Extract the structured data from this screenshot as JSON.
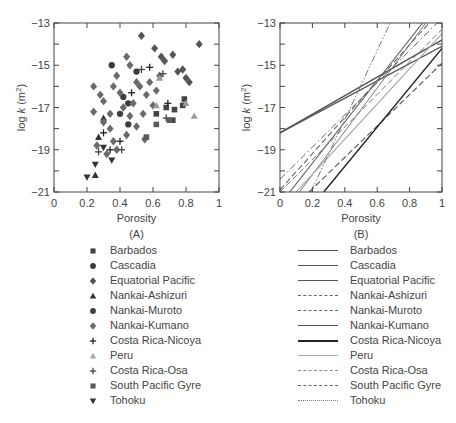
{
  "chart_data": [
    {
      "type": "scatter",
      "panel_label": "(A)",
      "xlabel": "Porosity",
      "ylabel": "log k (m2)",
      "xlim": [
        0,
        1
      ],
      "ylim": [
        -21,
        -13
      ],
      "x_ticks": [
        "0",
        "0.2",
        "0.4",
        "0.6",
        "0.8",
        "1"
      ],
      "y_ticks": [
        "-13",
        "-15",
        "-17",
        "-19",
        "-21"
      ],
      "grid": false,
      "series": [
        {
          "name": "Barbados",
          "marker": "square",
          "color": "#444444",
          "points": [
            [
              0.62,
              -17.3
            ],
            [
              0.68,
              -17.0
            ],
            [
              0.72,
              -17.6
            ],
            [
              0.78,
              -16.9
            ],
            [
              0.79,
              -16.6
            ],
            [
              0.73,
              -17.1
            ]
          ]
        },
        {
          "name": "Cascadia",
          "marker": "circle",
          "color": "#3a3a3a",
          "points": [
            [
              0.35,
              -15.0
            ],
            [
              0.5,
              -15.3
            ],
            [
              0.45,
              -16.8
            ]
          ]
        },
        {
          "name": "Equatorial Pacific",
          "marker": "diamond",
          "color": "#555555",
          "points": [
            [
              0.53,
              -13.6
            ],
            [
              0.88,
              -14.0
            ],
            [
              0.61,
              -14.2
            ],
            [
              0.67,
              -14.8
            ],
            [
              0.72,
              -14.5
            ],
            [
              0.78,
              -15.2
            ],
            [
              0.8,
              -15.6
            ],
            [
              0.82,
              -15.8
            ],
            [
              0.75,
              -15.3
            ],
            [
              0.65,
              -14.6
            ]
          ]
        },
        {
          "name": "Nankai-Ashizuri",
          "marker": "triangle-up",
          "color": "#333333",
          "points": [
            [
              0.25,
              -20.2
            ],
            [
              0.27,
              -18.4
            ],
            [
              0.3,
              -17.5
            ]
          ]
        },
        {
          "name": "Nankai-Muroto",
          "marker": "circle",
          "color": "#3f3f3f",
          "points": [
            [
              0.4,
              -17.3
            ],
            [
              0.45,
              -17.8
            ],
            [
              0.42,
              -16.5
            ]
          ]
        },
        {
          "name": "Nankai-Kumano",
          "marker": "diamond",
          "color": "#6a6a6a",
          "points": [
            [
              0.24,
              -16.0
            ],
            [
              0.24,
              -17.2
            ],
            [
              0.28,
              -16.4
            ],
            [
              0.3,
              -17.7
            ],
            [
              0.34,
              -18.0
            ],
            [
              0.36,
              -16.0
            ],
            [
              0.38,
              -15.5
            ],
            [
              0.4,
              -16.3
            ],
            [
              0.42,
              -17.0
            ],
            [
              0.44,
              -18.3
            ],
            [
              0.46,
              -17.4
            ],
            [
              0.48,
              -16.8
            ],
            [
              0.5,
              -17.9
            ],
            [
              0.52,
              -16.0
            ],
            [
              0.54,
              -17.3
            ],
            [
              0.56,
              -16.4
            ],
            [
              0.58,
              -15.8
            ],
            [
              0.6,
              -16.9
            ],
            [
              0.62,
              -16.2
            ],
            [
              0.64,
              -15.5
            ],
            [
              0.36,
              -18.6
            ],
            [
              0.32,
              -19.2
            ],
            [
              0.26,
              -18.8
            ],
            [
              0.38,
              -19.0
            ],
            [
              0.46,
              -15.0
            ],
            [
              0.5,
              -15.8
            ],
            [
              0.44,
              -14.6
            ],
            [
              0.55,
              -18.5
            ],
            [
              0.3,
              -16.7
            ],
            [
              0.34,
              -17.3
            ]
          ]
        },
        {
          "name": "Costa Rica-Nicoya",
          "marker": "plus",
          "color": "#222222",
          "points": [
            [
              0.3,
              -18.2
            ],
            [
              0.34,
              -19.0
            ],
            [
              0.4,
              -18.6
            ],
            [
              0.58,
              -15.1
            ],
            [
              0.47,
              -16.3
            ],
            [
              0.69,
              -16.8
            ]
          ]
        },
        {
          "name": "Peru",
          "marker": "triangle-up",
          "color": "#999999",
          "points": [
            [
              0.85,
              -17.4
            ],
            [
              0.8,
              -16.8
            ],
            [
              0.64,
              -15.6
            ],
            [
              0.62,
              -16.9
            ]
          ]
        },
        {
          "name": "Costa Rica-Osa",
          "marker": "plus",
          "color": "#444444",
          "points": [
            [
              0.27,
              -19.1
            ],
            [
              0.41,
              -19.0
            ],
            [
              0.68,
              -17.5
            ],
            [
              0.53,
              -15.2
            ],
            [
              0.66,
              -15.4
            ]
          ]
        },
        {
          "name": "South Pacific Gyre",
          "marker": "square",
          "color": "#5a5a5a",
          "points": [
            [
              0.62,
              -17.8
            ],
            [
              0.56,
              -18.4
            ],
            [
              0.7,
              -17.6
            ]
          ]
        },
        {
          "name": "Tohoku",
          "marker": "triangle-down",
          "color": "#333333",
          "points": [
            [
              0.2,
              -20.3
            ],
            [
              0.25,
              -19.7
            ],
            [
              0.35,
              -19.5
            ],
            [
              0.3,
              -18.9
            ]
          ]
        }
      ]
    },
    {
      "type": "line",
      "panel_label": "(B)",
      "xlabel": "Porosity",
      "ylabel": "log k (m2)",
      "xlim": [
        0,
        1
      ],
      "ylim": [
        -21,
        -13
      ],
      "x_ticks": [
        "0",
        "0.2",
        "0.4",
        "0.6",
        "0.8",
        "1"
      ],
      "y_ticks": [
        "-13",
        "-15",
        "-17",
        "-19",
        "-21"
      ],
      "grid": false,
      "series": [
        {
          "name": "Barbados",
          "style": "solid",
          "color": "#555555",
          "width": 1.3,
          "points": [
            [
              0,
              -18.2
            ],
            [
              1,
              -13.8
            ]
          ]
        },
        {
          "name": "Cascadia",
          "style": "solid",
          "color": "#555555",
          "width": 1.3,
          "points": [
            [
              0,
              -18.2
            ],
            [
              1,
              -14.1
            ]
          ]
        },
        {
          "name": "Equatorial Pacific",
          "style": "solid",
          "color": "#666666",
          "width": 1.2,
          "points": [
            [
              0.06,
              -21
            ],
            [
              0.88,
              -13
            ]
          ]
        },
        {
          "name": "Nankai-Ashizuri",
          "style": "dashed",
          "color": "#666666",
          "width": 1.1,
          "points": [
            [
              0,
              -20.9
            ],
            [
              0.92,
              -13
            ]
          ]
        },
        {
          "name": "Nankai-Muroto",
          "style": "dashed",
          "color": "#555555",
          "width": 1.1,
          "points": [
            [
              0.18,
              -21
            ],
            [
              1,
              -14.9
            ]
          ]
        },
        {
          "name": "Nankai-Kumano",
          "style": "solid",
          "color": "#777777",
          "width": 1.0,
          "points": [
            [
              0.12,
              -21
            ],
            [
              0.9,
              -13
            ]
          ]
        },
        {
          "name": "Costa Rica-Nicoya",
          "style": "solid",
          "color": "#222222",
          "width": 1.4,
          "points": [
            [
              0.27,
              -21
            ],
            [
              1,
              -14.2
            ]
          ]
        },
        {
          "name": "Peru",
          "style": "solid",
          "color": "#aaaaaa",
          "width": 1.2,
          "points": [
            [
              0.1,
              -21
            ],
            [
              1,
              -13.5
            ]
          ]
        },
        {
          "name": "Costa Rica-Osa",
          "style": "dashdot",
          "color": "#666666",
          "width": 1.0,
          "points": [
            [
              0,
              -20.4
            ],
            [
              0.97,
              -13
            ]
          ]
        },
        {
          "name": "South Pacific Gyre",
          "style": "dashed",
          "color": "#777777",
          "width": 1.0,
          "points": [
            [
              0,
              -21
            ],
            [
              1,
              -13.3
            ]
          ]
        },
        {
          "name": "Tohoku",
          "style": "dashdotdot",
          "color": "#777777",
          "width": 1.0,
          "points": [
            [
              0.19,
              -21
            ],
            [
              0.68,
              -13
            ]
          ]
        }
      ]
    }
  ],
  "panels": {
    "a": {
      "label": "(A)",
      "xlabel": "Porosity",
      "ylabel_main": "log ",
      "ylabel_k": "k",
      "ylabel_unit": " (m",
      "ylabel_sup": "2",
      "ylabel_close": ")"
    },
    "b": {
      "label": "(B)",
      "xlabel": "Porosity",
      "ylabel_main": "log ",
      "ylabel_k": "k",
      "ylabel_unit": " (m",
      "ylabel_sup": "2",
      "ylabel_close": ")"
    }
  },
  "ticks": {
    "x": [
      "0",
      "0.2",
      "0.4",
      "0.6",
      "0.8",
      "1"
    ],
    "y": [
      "-13",
      "-15",
      "-17",
      "-19",
      "-21"
    ]
  },
  "legend_a": [
    {
      "label": "Barbados",
      "marker": "square"
    },
    {
      "label": "Cascadia",
      "marker": "circle"
    },
    {
      "label": "Equatorial Pacific",
      "marker": "diamond"
    },
    {
      "label": "Nankai-Ashizuri",
      "marker": "triangle-up"
    },
    {
      "label": "Nankai-Muroto",
      "marker": "circle"
    },
    {
      "label": "Nankai-Kumano",
      "marker": "diamond"
    },
    {
      "label": "Costa Rica-Nicoya",
      "marker": "plus"
    },
    {
      "label": "Peru",
      "marker": "triangle-up-light"
    },
    {
      "label": "Costa Rica-Osa",
      "marker": "plus"
    },
    {
      "label": "South Pacific Gyre",
      "marker": "square"
    },
    {
      "label": "Tohoku",
      "marker": "triangle-down"
    }
  ],
  "legend_b": [
    {
      "label": "Barbados",
      "style": "solid"
    },
    {
      "label": "Cascadia",
      "style": "solid"
    },
    {
      "label": "Equatorial Pacific",
      "style": "solid"
    },
    {
      "label": "Nankai-Ashizuri",
      "style": "dashed"
    },
    {
      "label": "Nankai-Muroto",
      "style": "dashed"
    },
    {
      "label": "Nankai-Kumano",
      "style": "solid"
    },
    {
      "label": "Costa Rica-Nicoya",
      "style": "solid-bold"
    },
    {
      "label": "Peru",
      "style": "solid-light"
    },
    {
      "label": "Costa Rica-Osa",
      "style": "dashdot"
    },
    {
      "label": "South Pacific Gyre",
      "style": "dashed"
    },
    {
      "label": "Tohoku",
      "style": "dashdotdot"
    }
  ]
}
